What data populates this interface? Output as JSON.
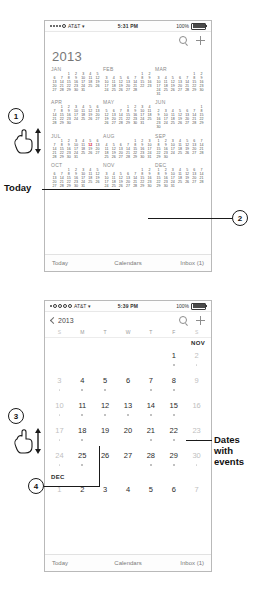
{
  "figure": {
    "annotations": [
      {
        "id": "1",
        "kind": "callout-number",
        "label": "1"
      },
      {
        "id": "2",
        "kind": "callout-number",
        "label": "2"
      },
      {
        "id": "3",
        "kind": "callout-number",
        "label": "3"
      },
      {
        "id": "4",
        "kind": "callout-number",
        "label": "4"
      },
      {
        "id": "today",
        "kind": "text-label",
        "label": "Today"
      },
      {
        "id": "dates-with-events",
        "kind": "text-label",
        "label": "Dates\nwith\nevents"
      }
    ]
  },
  "phone_year": {
    "status_bar": {
      "carrier": "AT&T",
      "signal_dots": 5,
      "signal_filled": 4,
      "wifi_icon": "wifi-icon",
      "time": "5:31 PM",
      "battery_percent": "100%"
    },
    "nav": {
      "title": "",
      "search_icon": "search-icon",
      "add_icon": "plus-icon"
    },
    "year_label": "2013",
    "months": [
      {
        "name": "JAN",
        "lead": 2,
        "days": 31,
        "today": 0
      },
      {
        "name": "FEB",
        "lead": 5,
        "days": 28,
        "today": 0
      },
      {
        "name": "MAR",
        "lead": 5,
        "days": 31,
        "today": 0
      },
      {
        "name": "APR",
        "lead": 1,
        "days": 30,
        "today": 0
      },
      {
        "name": "MAY",
        "lead": 3,
        "days": 31,
        "today": 0
      },
      {
        "name": "JUN",
        "lead": 6,
        "days": 30,
        "today": 0
      },
      {
        "name": "JUL",
        "lead": 1,
        "days": 31,
        "today": 12
      },
      {
        "name": "AUG",
        "lead": 4,
        "days": 31,
        "today": 0
      },
      {
        "name": "SEP",
        "lead": 0,
        "days": 30,
        "today": 0
      },
      {
        "name": "OCT",
        "lead": 2,
        "days": 31,
        "today": 0
      },
      {
        "name": "NOV",
        "lead": 5,
        "days": 30,
        "today": 0
      },
      {
        "name": "DEC",
        "lead": 0,
        "days": 31,
        "today": 0
      }
    ],
    "tabbar": {
      "today": "Today",
      "calendars": "Calendars",
      "inbox": "Inbox (1)"
    }
  },
  "phone_month": {
    "status_bar": {
      "carrier": "AT&T",
      "signal_dots": 5,
      "signal_filled": 1,
      "wifi_icon": "wifi-icon",
      "time": "5:39 PM",
      "battery_percent": "100%"
    },
    "nav": {
      "back_label": "2013",
      "back_icon": "chevron-left-icon",
      "search_icon": "search-icon",
      "add_icon": "plus-icon"
    },
    "weekdays": [
      "S",
      "M",
      "T",
      "W",
      "T",
      "F",
      "S"
    ],
    "nov_label": "NOV",
    "dec_label": "DEC",
    "rows": [
      {
        "cells": [
          {
            "n": "",
            "empty": true
          },
          {
            "n": "",
            "empty": true
          },
          {
            "n": "",
            "empty": true
          },
          {
            "n": "",
            "empty": true
          },
          {
            "n": "",
            "empty": true
          },
          {
            "n": "1",
            "dot": true,
            "dim": false
          },
          {
            "n": "2",
            "dot": true,
            "dim": true
          }
        ]
      },
      {
        "cells": [
          {
            "n": "3",
            "dot": true,
            "dim": true
          },
          {
            "n": "4",
            "dot": true,
            "dim": false
          },
          {
            "n": "5",
            "dot": true,
            "dim": false
          },
          {
            "n": "6",
            "dot": false,
            "dim": false
          },
          {
            "n": "7",
            "dot": true,
            "dim": false
          },
          {
            "n": "8",
            "dot": true,
            "dim": false
          },
          {
            "n": "9",
            "dot": false,
            "dim": true
          }
        ]
      },
      {
        "cells": [
          {
            "n": "10",
            "dot": true,
            "dim": true
          },
          {
            "n": "11",
            "dot": true,
            "dim": false
          },
          {
            "n": "12",
            "dot": true,
            "dim": false
          },
          {
            "n": "13",
            "dot": true,
            "dim": false
          },
          {
            "n": "14",
            "dot": true,
            "dim": false
          },
          {
            "n": "15",
            "dot": true,
            "dim": false
          },
          {
            "n": "16",
            "dot": false,
            "dim": true
          }
        ]
      },
      {
        "cells": [
          {
            "n": "17",
            "dot": true,
            "dim": true
          },
          {
            "n": "18",
            "dot": true,
            "dim": false
          },
          {
            "n": "19",
            "dot": false,
            "dim": false
          },
          {
            "n": "20",
            "dot": false,
            "dim": false
          },
          {
            "n": "21",
            "dot": true,
            "dim": false
          },
          {
            "n": "22",
            "dot": true,
            "dim": false
          },
          {
            "n": "23",
            "dot": true,
            "dim": true
          }
        ]
      },
      {
        "cells": [
          {
            "n": "24",
            "dot": true,
            "dim": true
          },
          {
            "n": "25",
            "dot": true,
            "dim": false
          },
          {
            "n": "26",
            "dot": false,
            "dim": false
          },
          {
            "n": "27",
            "dot": false,
            "dim": false
          },
          {
            "n": "28",
            "dot": true,
            "dim": false
          },
          {
            "n": "29",
            "dot": true,
            "dim": false
          },
          {
            "n": "30",
            "dot": true,
            "dim": true
          }
        ]
      }
    ],
    "dec_rows": [
      {
        "cells": [
          {
            "n": "1",
            "dot": false,
            "dim": true
          },
          {
            "n": "2",
            "dot": false,
            "dim": false
          },
          {
            "n": "3",
            "dot": false,
            "dim": false
          },
          {
            "n": "4",
            "dot": false,
            "dim": false
          },
          {
            "n": "5",
            "dot": false,
            "dim": false
          },
          {
            "n": "6",
            "dot": false,
            "dim": false
          },
          {
            "n": "7",
            "dot": false,
            "dim": true
          }
        ]
      }
    ],
    "tabbar": {
      "today": "Today",
      "calendars": "Calendars",
      "inbox": "Inbox (1)"
    }
  }
}
